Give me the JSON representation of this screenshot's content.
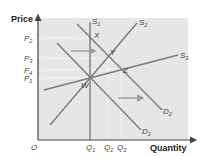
{
  "axes": {
    "y_label": "Price",
    "x_label": "Quantity",
    "origin": "O"
  },
  "price_ticks": [
    {
      "label": "P",
      "sub": "2",
      "y": 38
    },
    {
      "label": "P",
      "sub": "3",
      "y": 58
    },
    {
      "label": "P",
      "sub": "4",
      "y": 70
    },
    {
      "label": "P",
      "sub": "1",
      "y": 78
    }
  ],
  "quantity_ticks": [
    {
      "label": "Q",
      "sub": "1",
      "x": 90
    },
    {
      "label": "Q",
      "sub": "2",
      "x": 108
    },
    {
      "label": "Q",
      "sub": "3",
      "x": 121
    }
  ],
  "curves": [
    {
      "name": "S",
      "sub": "1",
      "x1": 90,
      "y1": 22,
      "x2": 90,
      "y2": 140
    },
    {
      "name": "S",
      "sub": "2",
      "x1": 50,
      "y1": 125,
      "x2": 137,
      "y2": 23
    },
    {
      "name": "S",
      "sub": "3",
      "x1": 44,
      "y1": 90,
      "x2": 178,
      "y2": 55
    },
    {
      "name": "D",
      "sub": "1",
      "x1": 57,
      "y1": 43,
      "x2": 141,
      "y2": 130
    },
    {
      "name": "D",
      "sub": "2",
      "x1": 77,
      "y1": 24,
      "x2": 162,
      "y2": 110
    }
  ],
  "points": [
    {
      "label": "W",
      "x": 90,
      "y": 78
    },
    {
      "label": "X",
      "x": 90,
      "y": 37
    },
    {
      "label": "Y",
      "x": 108,
      "y": 55
    },
    {
      "label": "Z",
      "x": 121,
      "y": 69
    }
  ],
  "arrows": [
    {
      "x1": 71,
      "y1": 51,
      "x2": 95,
      "y2": 51
    },
    {
      "x1": 118,
      "y1": 98,
      "x2": 143,
      "y2": 98
    }
  ],
  "colors": {
    "plot_bg": "#e6e6e6",
    "curve": "#7a7a7a",
    "axis": "#444444",
    "arrow": "#9a9a9a",
    "guide": "#ffffff"
  }
}
